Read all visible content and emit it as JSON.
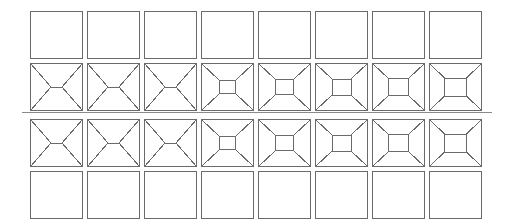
{
  "figure": {
    "title": "",
    "background_color": "#ffffff",
    "stroke_color": "#6a6a6a",
    "stroke_width": 1,
    "width": 505,
    "height": 222
  },
  "grid": {
    "columns": 8,
    "rows": 4,
    "cell_width": 52,
    "cell_height": 47,
    "origin_x": 30,
    "origin_y": 11,
    "pitch_x": 57,
    "row_tops": [
      11,
      63,
      119,
      171
    ]
  },
  "divider": {
    "name": "horizontal-rule",
    "x1": 22,
    "x2": 492,
    "y": 112,
    "color": "#8a8a8a",
    "width": 1
  },
  "rows": [
    {
      "index": 0,
      "label": "row-1-empty",
      "type": "empty",
      "top": 11,
      "cells": [
        {
          "col": 0,
          "inner_w": 0,
          "inner_h": 0
        },
        {
          "col": 1,
          "inner_w": 0,
          "inner_h": 0
        },
        {
          "col": 2,
          "inner_w": 0,
          "inner_h": 0
        },
        {
          "col": 3,
          "inner_w": 0,
          "inner_h": 0
        },
        {
          "col": 4,
          "inner_w": 0,
          "inner_h": 0
        },
        {
          "col": 5,
          "inner_w": 0,
          "inner_h": 0
        },
        {
          "col": 6,
          "inner_w": 0,
          "inner_h": 0
        },
        {
          "col": 7,
          "inner_w": 0,
          "inner_h": 0
        }
      ]
    },
    {
      "index": 1,
      "label": "row-2-frustum",
      "type": "frustum",
      "top": 63,
      "cells": [
        {
          "col": 0,
          "inner_w": 11,
          "inner_h": 0
        },
        {
          "col": 1,
          "inner_w": 11,
          "inner_h": 0
        },
        {
          "col": 2,
          "inner_w": 11,
          "inner_h": 0
        },
        {
          "col": 3,
          "inner_w": 16,
          "inner_h": 13
        },
        {
          "col": 4,
          "inner_w": 18,
          "inner_h": 15
        },
        {
          "col": 5,
          "inner_w": 19,
          "inner_h": 16
        },
        {
          "col": 6,
          "inner_w": 20,
          "inner_h": 17
        },
        {
          "col": 7,
          "inner_w": 22,
          "inner_h": 18
        }
      ]
    },
    {
      "index": 2,
      "label": "row-3-frustum",
      "type": "frustum",
      "top": 119,
      "cells": [
        {
          "col": 0,
          "inner_w": 11,
          "inner_h": 0
        },
        {
          "col": 1,
          "inner_w": 11,
          "inner_h": 0
        },
        {
          "col": 2,
          "inner_w": 11,
          "inner_h": 0
        },
        {
          "col": 3,
          "inner_w": 16,
          "inner_h": 13
        },
        {
          "col": 4,
          "inner_w": 18,
          "inner_h": 15
        },
        {
          "col": 5,
          "inner_w": 19,
          "inner_h": 16
        },
        {
          "col": 6,
          "inner_w": 20,
          "inner_h": 17
        },
        {
          "col": 7,
          "inner_w": 22,
          "inner_h": 18
        }
      ]
    },
    {
      "index": 3,
      "label": "row-4-empty",
      "type": "empty",
      "top": 171,
      "cells": [
        {
          "col": 0,
          "inner_w": 0,
          "inner_h": 0
        },
        {
          "col": 1,
          "inner_w": 0,
          "inner_h": 0
        },
        {
          "col": 2,
          "inner_w": 0,
          "inner_h": 0
        },
        {
          "col": 3,
          "inner_w": 0,
          "inner_h": 0
        },
        {
          "col": 4,
          "inner_w": 0,
          "inner_h": 0
        },
        {
          "col": 5,
          "inner_w": 0,
          "inner_h": 0
        },
        {
          "col": 6,
          "inner_w": 0,
          "inner_h": 0
        },
        {
          "col": 7,
          "inner_w": 0,
          "inner_h": 0
        }
      ]
    }
  ]
}
